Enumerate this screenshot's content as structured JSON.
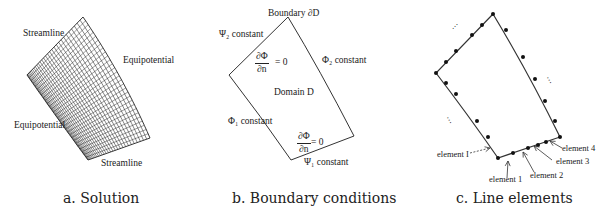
{
  "figure": {
    "panels": [
      {
        "id": "a",
        "caption": "a. Solution",
        "labels": {
          "streamline_top": "Streamline",
          "equipotential_right": "Equipotential",
          "equipotential_left": "Equipotential",
          "streamline_bottom": "Streamline"
        }
      },
      {
        "id": "b",
        "caption": "b. Boundary conditions",
        "labels": {
          "boundary": "Boundary ∂D",
          "psi2": "Ψ₂ constant",
          "dphi_dn_top_num": "∂Φ",
          "dphi_dn_top_den": "∂n",
          "dphi_dn_top_eq": "= 0",
          "phi2": "Φ₂ constant",
          "domain": "Domain D",
          "phi1": "Φ₁ constant",
          "dphi_dn_bottom_num": "∂Φ",
          "dphi_dn_bottom_den": "∂n",
          "dphi_dn_bottom_eq": "= 0",
          "psi1": "Ψ₁ constant"
        }
      },
      {
        "id": "c",
        "caption": "c. Line elements",
        "labels": {
          "element_I": "element I",
          "element_1": "element 1",
          "element_2": "element 2",
          "element_3": "element 3",
          "element_4": "element 4",
          "ellipsis": "⋯"
        }
      }
    ],
    "colors": {
      "line": "#333333",
      "grid_dark": "#111111",
      "background": "#ffffff"
    }
  }
}
